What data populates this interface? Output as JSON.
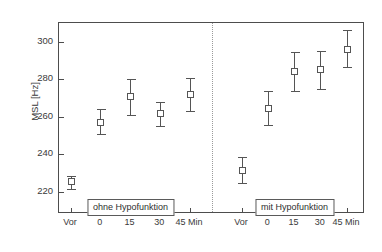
{
  "chart_data": {
    "type": "scatter",
    "title": "",
    "subtitle": "",
    "xlabel": "",
    "ylabel": "MSL [Hz]",
    "ylim": [
      208,
      310
    ],
    "yticks": [
      220,
      240,
      260,
      280,
      300
    ],
    "ytick_labels": [
      "220",
      "240",
      "260",
      "280",
      "300"
    ],
    "grid": false,
    "legend_position": "none",
    "error_bars": "vertical, capped (mean ± error)",
    "categories": [
      "Vor",
      "0",
      "15",
      "30",
      "45 Min"
    ],
    "groups": [
      {
        "name": "ohne Hypofunktion",
        "annotation": "ohne Hypofunktion",
        "points": [
          {
            "x": "Vor",
            "value": 225.5,
            "low": 221.5,
            "high": 228.5
          },
          {
            "x": "0",
            "value": 257.0,
            "low": 250.5,
            "high": 264.0
          },
          {
            "x": "15",
            "value": 271.0,
            "low": 261.0,
            "high": 280.0
          },
          {
            "x": "30",
            "value": 261.5,
            "low": 255.0,
            "high": 268.0
          },
          {
            "x": "45 Min",
            "value": 272.0,
            "low": 263.0,
            "high": 280.5
          }
        ]
      },
      {
        "name": "mit Hypofunktion",
        "annotation": "mit Hypofunktion",
        "points": [
          {
            "x": "Vor",
            "value": 231.0,
            "low": 224.5,
            "high": 238.5
          },
          {
            "x": "0",
            "value": 264.5,
            "low": 255.5,
            "high": 273.5
          },
          {
            "x": "15",
            "value": 284.0,
            "low": 273.5,
            "high": 294.5
          },
          {
            "x": "30",
            "value": 285.0,
            "low": 275.0,
            "high": 295.0
          },
          {
            "x": "45 Min",
            "value": 296.0,
            "low": 286.5,
            "high": 306.0
          }
        ]
      }
    ],
    "divider": {
      "present": true,
      "style": "dotted",
      "between": [
        "ohne Hypofunktion",
        "mit Hypofunktion"
      ]
    },
    "colors": {
      "axis": "#4d4d4d",
      "marker_edge": "#555555",
      "marker_face": "#ffffff",
      "error_bar": "#555555",
      "divider": "#9a9a9a",
      "text": "#3a3a3a",
      "background": "#ffffff"
    }
  }
}
